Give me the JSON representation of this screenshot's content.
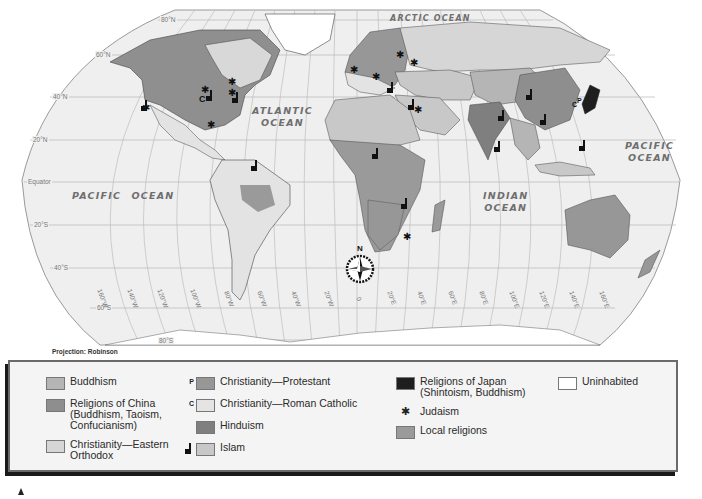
{
  "map": {
    "title": "World Religions",
    "projection_label": "Projection: Robinson",
    "ocean_labels": {
      "arctic": "ARCTIC OCEAN",
      "atlantic_1": "ATLANTIC",
      "atlantic_2": "OCEAN",
      "pacific_west_1": "PACIFIC  OCEAN",
      "pacific_east_1": "PACIFIC",
      "pacific_east_2": "OCEAN",
      "indian_1": "INDIAN",
      "indian_2": "OCEAN"
    },
    "latitude_labels": [
      "80°N",
      "60°N",
      "40°N",
      "20°N",
      "Equator",
      "20°S",
      "40°S",
      "60°S",
      "80°S"
    ],
    "longitude_labels": [
      "160°W",
      "140°W",
      "120°W",
      "100°W",
      "80°W",
      "60°W",
      "40°W",
      "20°W",
      "0",
      "20°E",
      "40°E",
      "60°E",
      "80°E",
      "100°E",
      "120°E",
      "140°E",
      "160°E"
    ],
    "compass_label": "N",
    "map_symbols": {
      "catholic_marker": "C",
      "protestant_marker": "P",
      "judaism_marker": "✱"
    }
  },
  "legend": {
    "columns": [
      [
        {
          "label": "Buddhism",
          "color": "#b5b5b5",
          "prefix": ""
        },
        {
          "label": "Religions of China (Buddhism, Taoism, Confucianism)",
          "line1": "Religions of China",
          "line2": "(Buddhism, Taoism,",
          "line3": "Confucianism)",
          "color": "#8e8e8e",
          "prefix": ""
        },
        {
          "label": "Christianity—Eastern Orthodox",
          "line1": "Christianity—Eastern",
          "line2": "Orthodox",
          "color": "#d6d6d6",
          "prefix": ""
        }
      ],
      [
        {
          "label": "Christianity—Protestant",
          "color": "#979797",
          "prefix": "P"
        },
        {
          "label": "Christianity—Roman Catholic",
          "color": "#e4e4e4",
          "prefix": "C"
        },
        {
          "label": "Hinduism",
          "color": "#7f7f7f",
          "prefix": ""
        },
        {
          "label": "Islam",
          "color": "#c8c8c8",
          "prefix": "mosque"
        }
      ],
      [
        {
          "label": "Religions of Japan (Shintoism, Buddhism)",
          "line1": "Religions of Japan",
          "line2": "(Shintoism, Buddhism)",
          "color": "#1e1e1e",
          "prefix": ""
        },
        {
          "label": "Judaism",
          "symbol": "✱"
        },
        {
          "label": "Local religions",
          "color": "#9a9a9a",
          "prefix": ""
        }
      ],
      [
        {
          "label": "Uninhabited",
          "color": "#ffffff",
          "prefix": ""
        }
      ]
    ]
  },
  "colors": {
    "ocean": "#efefef",
    "grid": "#b8b8b8",
    "border": "#555555",
    "legend_bg": "#f4f4f4",
    "legend_frame": "#6a6a6a"
  }
}
